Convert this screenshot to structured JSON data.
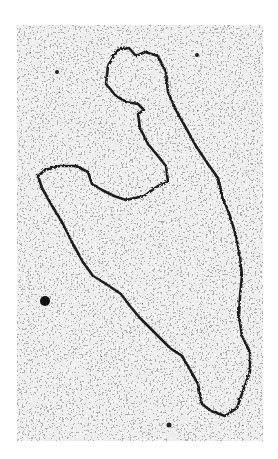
{
  "image": {
    "type": "electron-micrograph",
    "subject": "circular DNA molecule loop",
    "background_color": "#ffffff",
    "frame": {
      "x": 17,
      "y": 25,
      "width": 246,
      "height": 416
    },
    "colors": {
      "grain_dark": "#2a2a2a",
      "grain_light": "#f2f2f2",
      "strand": "#1e1e1e"
    }
  }
}
